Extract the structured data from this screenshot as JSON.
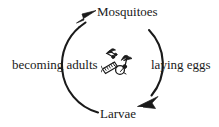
{
  "diagram": {
    "type": "cycle-diagram",
    "background_color": "#ffffff",
    "ink_color": "#1a1a1a",
    "labels": {
      "top": "Mosquitoes",
      "right": "laying eggs",
      "bottom": "Larvae",
      "left": "becoming adults"
    },
    "stages": [
      {
        "position": "top",
        "label": "Mosquitoes",
        "is_stage": true
      },
      {
        "position": "right",
        "label": "laying eggs",
        "is_stage": false
      },
      {
        "position": "bottom",
        "label": "Larvae",
        "is_stage": true
      },
      {
        "position": "left",
        "label": "becoming adults",
        "is_stage": false
      }
    ],
    "arrows": [
      {
        "name": "arrow-to-mosquitoes",
        "points_to": "Mosquitoes",
        "location": "top-left",
        "direction": "up-right"
      },
      {
        "name": "arrow-to-larvae",
        "points_to": "Larvae",
        "location": "bottom-right",
        "direction": "down-left"
      }
    ],
    "circle": {
      "center_x": 111,
      "center_y": 64,
      "radius": 49,
      "stroke_width": 2,
      "direction": "clockwise"
    },
    "center_illustration": {
      "name": "mosquito-and-larvae-illustration",
      "description": "small line drawing of mosquitoes above a larva and water droplet"
    }
  }
}
